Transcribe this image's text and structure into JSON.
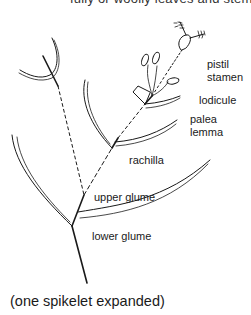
{
  "header": {
    "clipped_text": "fully or woolly leaves and stems"
  },
  "diagram": {
    "labels": {
      "pistil": "pistil",
      "stamen": "stamen",
      "lodicule": "lodicule",
      "palea": "palea",
      "lemma": "lemma",
      "rachilla": "rachilla",
      "upper_glume": "upper glume",
      "lower_glume": "lower glume"
    },
    "caption": "(one spikelet expanded)",
    "colors": {
      "ink": "#1a1a1a",
      "background": "#ffffff"
    }
  }
}
